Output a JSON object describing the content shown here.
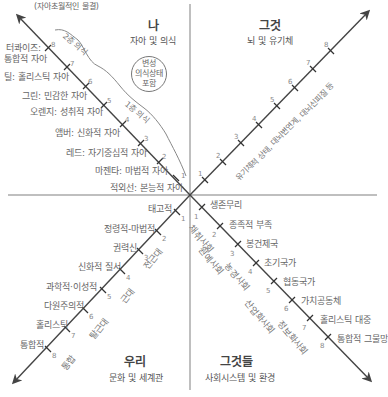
{
  "quadrants": {
    "upper_left": {
      "title": "나",
      "subtitle": "자아 및 의식",
      "top_note": "(자아초월적인 물결)",
      "circle_note": [
        "변성",
        "의식상태",
        "포함"
      ],
      "tier_labels": [
        "2층 의식",
        "1층 의식"
      ],
      "levels": [
        {
          "n": "1",
          "label": "적외선: 본능적 자아"
        },
        {
          "n": "2",
          "label": "마젠타: 마법적 자아"
        },
        {
          "n": "3",
          "label": "레드: 자기중심적 자아"
        },
        {
          "n": "4",
          "label": "앰버: 신화적 자아"
        },
        {
          "n": "5",
          "label": "오렌지: 성취적 자아"
        },
        {
          "n": "6",
          "label": "그린: 민감한 자아"
        },
        {
          "n": "7",
          "label": "틸: 홀리스틱 자아"
        },
        {
          "n": "8",
          "label": "터콰이즈: 통합적 자아",
          "label_lines": [
            "터콰이즈:",
            "통합적 자아"
          ]
        }
      ]
    },
    "upper_right": {
      "title": "그것",
      "subtitle": "뇌 및 유기체",
      "axis_note": "유기체적 상태, 대뇌변연계, 대뇌신피질 등",
      "levels": [
        "1",
        "2",
        "3",
        "4",
        "5",
        "6",
        "7",
        "8"
      ]
    },
    "lower_left": {
      "title": "우리",
      "subtitle": "문화 및 세계관",
      "era_labels": [
        "전근대",
        "근대",
        "탈근대",
        "통합"
      ],
      "levels": [
        {
          "n": "1",
          "label": "태고적"
        },
        {
          "n": "2",
          "label": "정령적-마법적"
        },
        {
          "n": "3",
          "label": "권력신"
        },
        {
          "n": "4",
          "label": "신화적 질서"
        },
        {
          "n": "5",
          "label": "과학적·이성적"
        },
        {
          "n": "6",
          "label": "다원주의적"
        },
        {
          "n": "7",
          "label": "홀리스틱"
        },
        {
          "n": "8",
          "label": "통합적"
        }
      ]
    },
    "lower_right": {
      "title": "그것들",
      "subtitle": "사회시스템 및 환경",
      "society_labels": [
        "채취사회",
        "원예사회",
        "농경사회",
        "산업화사회",
        "정보화사회"
      ],
      "levels": [
        {
          "n": "1",
          "label": "생존무리"
        },
        {
          "n": "2",
          "label": "종족적 부족"
        },
        {
          "n": "3",
          "label": "봉건제국"
        },
        {
          "n": "4",
          "label": "초기국가"
        },
        {
          "n": "5",
          "label": "협동국가"
        },
        {
          "n": "6",
          "label": "가치공동체"
        },
        {
          "n": "7",
          "label": "홀리스틱 대중"
        },
        {
          "n": "8",
          "label": "통합적 그물망"
        }
      ]
    }
  },
  "colors": {
    "axis_line": "#aaaaaa",
    "arrow_line": "#444444",
    "text": "#666666"
  }
}
